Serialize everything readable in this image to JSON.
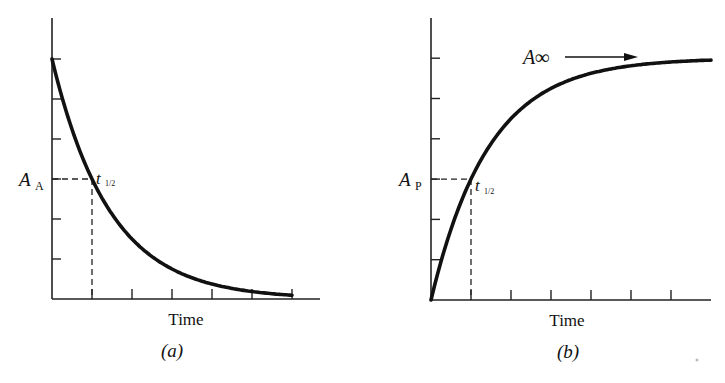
{
  "chart_data": [
    {
      "panel": "(a)",
      "type": "line",
      "title": "",
      "xlabel": "Time",
      "ylabel": "",
      "caption": "(a)",
      "y_marker_label": "A",
      "y_marker_subscript": "A",
      "point_label": "t",
      "point_label_subscript": "1/2",
      "grid": false,
      "description": "Exponential decay of reactant A; dashed lines mark half-life t1/2 where A falls to half its initial value",
      "x_ticks": 6,
      "y_ticks": 6,
      "xlim": [
        0,
        6
      ],
      "ylim": [
        0,
        6
      ],
      "series": [
        {
          "name": "A_A",
          "x": [
            0,
            0.5,
            1,
            1.5,
            2,
            3,
            4,
            5,
            6
          ],
          "y": [
            6,
            4.24,
            3,
            2.12,
            1.5,
            0.75,
            0.38,
            0.19,
            0.05
          ]
        }
      ],
      "half_life": {
        "x": 1,
        "y": 3
      }
    },
    {
      "panel": "(b)",
      "type": "line",
      "title": "",
      "xlabel": "Time",
      "ylabel": "",
      "caption": "(b)",
      "y_marker_label": "A",
      "y_marker_subscript": "P",
      "point_label": "t",
      "point_label_subscript": "1/2",
      "asymptote_label": "A∞",
      "grid": false,
      "description": "Exponential growth of product P approaching asymptote A∞; dashed lines mark half-life t1/2",
      "x_ticks": 6,
      "y_ticks": 6,
      "xlim": [
        0,
        7
      ],
      "ylim": [
        0,
        6
      ],
      "series": [
        {
          "name": "A_P",
          "x": [
            0,
            0.5,
            1,
            1.5,
            2,
            3,
            4,
            5,
            6,
            7
          ],
          "y": [
            0,
            1.76,
            3,
            3.88,
            4.5,
            5.25,
            5.62,
            5.81,
            5.9,
            5.95
          ]
        }
      ],
      "asymptote": 6,
      "half_life": {
        "x": 1,
        "y": 3
      }
    }
  ]
}
